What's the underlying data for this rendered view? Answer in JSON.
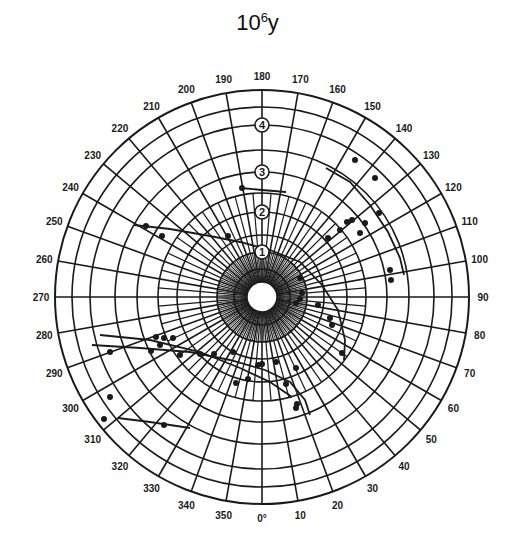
{
  "title": {
    "base": "10",
    "exponent": "6",
    "unit": "y"
  },
  "colors": {
    "ink": "#1a1a1a",
    "background": "#ffffff"
  },
  "polar": {
    "center": [
      262,
      297
    ],
    "outer_radius": 207,
    "inner_radius": 15,
    "angle_step_deg": 10,
    "angle_labels": [
      "0°",
      "10",
      "20",
      "30",
      "40",
      "50",
      "60",
      "70",
      "80",
      "90",
      "100",
      "110",
      "120",
      "130",
      "140",
      "150",
      "160",
      "170",
      "180",
      "190",
      "200",
      "210",
      "220",
      "230",
      "240",
      "250",
      "260",
      "270",
      "280",
      "290",
      "300",
      "310",
      "320",
      "330",
      "340",
      "350"
    ],
    "rings": [
      28,
      45,
      62,
      85,
      104,
      125,
      147,
      172,
      190,
      207
    ],
    "ring_labels": [
      {
        "text": "1",
        "radius": 45
      },
      {
        "text": "2",
        "radius": 85
      },
      {
        "text": "3",
        "radius": 125
      },
      {
        "text": "4",
        "radius": 172
      }
    ]
  },
  "curves": [
    {
      "name": "upper-left-curve",
      "points": [
        [
          134,
          225
        ],
        [
          170,
          229
        ],
        [
          210,
          236
        ],
        [
          240,
          242
        ],
        [
          270,
          250
        ],
        [
          300,
          262
        ],
        [
          322,
          285
        ],
        [
          338,
          310
        ],
        [
          345,
          340
        ],
        [
          344,
          360
        ]
      ]
    },
    {
      "name": "upper-right-arc",
      "points": [
        [
          326,
          168
        ],
        [
          350,
          182
        ],
        [
          370,
          205
        ],
        [
          388,
          232
        ],
        [
          400,
          258
        ],
        [
          404,
          275
        ]
      ]
    },
    {
      "name": "upper-left-short",
      "points": [
        [
          240,
          188
        ],
        [
          262,
          190
        ],
        [
          286,
          192
        ]
      ]
    },
    {
      "name": "left-middle-curve",
      "points": [
        [
          92,
          345
        ],
        [
          140,
          348
        ],
        [
          190,
          352
        ],
        [
          230,
          360
        ],
        [
          265,
          370
        ],
        [
          290,
          382
        ],
        [
          305,
          400
        ],
        [
          310,
          415
        ]
      ]
    },
    {
      "name": "left-lower-curve",
      "points": [
        [
          100,
          335
        ],
        [
          150,
          340
        ],
        [
          200,
          352
        ],
        [
          240,
          368
        ],
        [
          270,
          382
        ],
        [
          292,
          397
        ]
      ]
    },
    {
      "name": "bottom-left-line",
      "points": [
        [
          118,
          418
        ],
        [
          150,
          422
        ],
        [
          190,
          428
        ]
      ]
    }
  ],
  "points": [
    [
      146,
      226
    ],
    [
      162,
      236
    ],
    [
      242,
      188
    ],
    [
      228,
      236
    ],
    [
      355,
      160
    ],
    [
      375,
      178
    ],
    [
      379,
      213
    ],
    [
      347,
      222
    ],
    [
      352,
      220
    ],
    [
      360,
      233
    ],
    [
      365,
      223
    ],
    [
      328,
      238
    ],
    [
      340,
      230
    ],
    [
      390,
      270
    ],
    [
      391,
      280
    ],
    [
      300,
      278
    ],
    [
      302,
      293
    ],
    [
      318,
      305
    ],
    [
      330,
      318
    ],
    [
      332,
      325
    ],
    [
      342,
      353
    ],
    [
      300,
      299
    ],
    [
      296,
      303
    ],
    [
      151,
      351
    ],
    [
      180,
      355
    ],
    [
      156,
      337
    ],
    [
      164,
      338
    ],
    [
      173,
      338
    ],
    [
      160,
      345
    ],
    [
      200,
      354
    ],
    [
      214,
      354
    ],
    [
      233,
      352
    ],
    [
      262,
      364
    ],
    [
      276,
      362
    ],
    [
      296,
      368
    ],
    [
      248,
      379
    ],
    [
      286,
      384
    ],
    [
      297,
      404
    ],
    [
      296,
      408
    ],
    [
      110,
      352
    ],
    [
      110,
      397
    ],
    [
      104,
      419
    ],
    [
      164,
      425
    ],
    [
      236,
      383
    ],
    [
      258,
      365
    ]
  ]
}
